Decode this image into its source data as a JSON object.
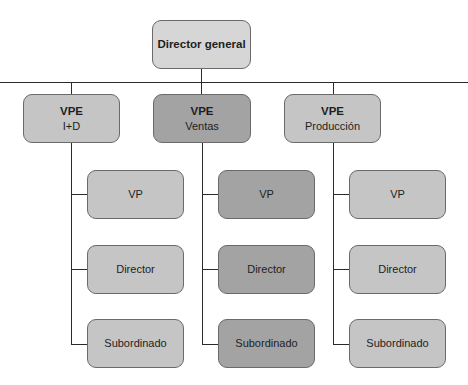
{
  "diagram": {
    "type": "org-chart",
    "root": {
      "label": "Director general"
    },
    "branches": [
      {
        "title": "VPE",
        "subtitle": "I+D",
        "shade": "light",
        "children": [
          "VP",
          "Director",
          "Subordinado"
        ]
      },
      {
        "title": "VPE",
        "subtitle": "Ventas",
        "shade": "dark",
        "children": [
          "VP",
          "Director",
          "Subordinado"
        ]
      },
      {
        "title": "VPE",
        "subtitle": "Producción",
        "shade": "light",
        "children": [
          "VP",
          "Director",
          "Subordinado"
        ]
      }
    ],
    "colors": {
      "root_fill": "#d6d6d6",
      "light_fill": "#c5c5c5",
      "dark_fill": "#a3a3a3",
      "border": "#6a6a6a",
      "connector": "#2a2a2a"
    }
  }
}
